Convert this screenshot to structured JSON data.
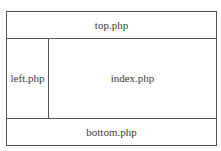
{
  "diagram": {
    "type": "page-layout",
    "regions": {
      "top": {
        "label": "top.php"
      },
      "left": {
        "label": "left.php"
      },
      "main": {
        "label": "index.php"
      },
      "bottom": {
        "label": "bottom.php"
      }
    },
    "colors": {
      "border": "#555555",
      "text": "#3a3a3a",
      "background": "#ffffff"
    }
  }
}
